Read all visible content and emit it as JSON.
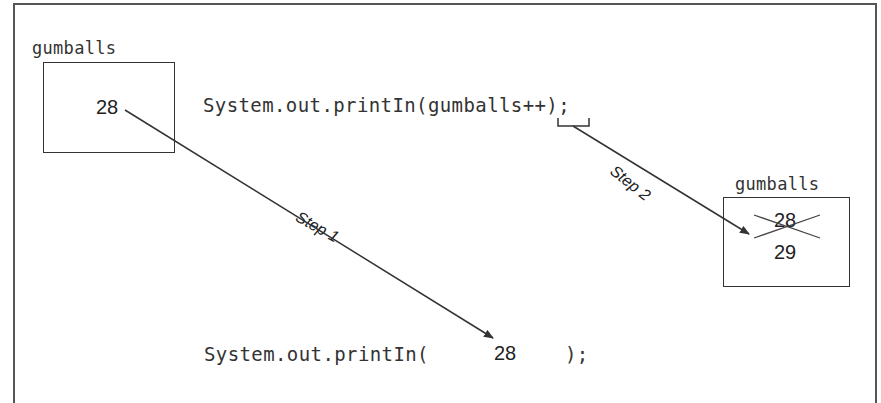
{
  "diagram": {
    "left_variable": {
      "name": "gumballs",
      "value": "28"
    },
    "top_statement": "System.out.printIn(gumballs++);",
    "right_variable": {
      "name": "gumballs",
      "old_value": "28",
      "new_value": "29"
    },
    "bottom_statement": {
      "prefix": "System.out.printIn(",
      "value": "28",
      "suffix": ");"
    },
    "steps": [
      {
        "label": "Step 1",
        "from": "left_variable.value",
        "to": "bottom_statement.value"
      },
      {
        "label": "Step 2",
        "from": "top_statement ++ operator",
        "to": "right_variable.old_value"
      }
    ],
    "colors": {
      "line": "#333333",
      "text": "#333333",
      "background": "#ffffff"
    }
  }
}
